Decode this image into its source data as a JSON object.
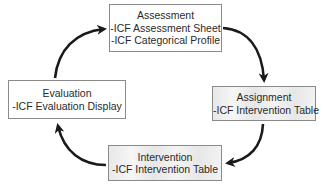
{
  "diagram": {
    "type": "cycle",
    "nodes": [
      {
        "id": "assessment",
        "title": "Assessment",
        "items": [
          "-ICF Assessment Sheet",
          "-ICF Categorical Profile"
        ]
      },
      {
        "id": "assignment",
        "title": "Assignment",
        "items": [
          "-ICF Intervention Table"
        ]
      },
      {
        "id": "intervention",
        "title": "Intervention",
        "items": [
          "-ICF Intervention Table"
        ]
      },
      {
        "id": "evaluation",
        "title": "Evaluation",
        "items": [
          "-ICF Evaluation Display"
        ]
      }
    ],
    "edges": [
      {
        "from": "assessment",
        "to": "assignment"
      },
      {
        "from": "assignment",
        "to": "intervention"
      },
      {
        "from": "intervention",
        "to": "evaluation"
      },
      {
        "from": "evaluation",
        "to": "assessment"
      }
    ],
    "colors": {
      "arrow": "#1a1a1a",
      "border": "#8a8a8a",
      "text": "#2a2a2a"
    }
  }
}
